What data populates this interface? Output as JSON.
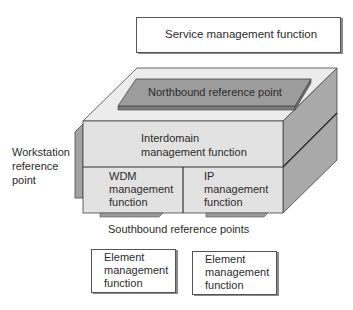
{
  "diagram": {
    "service_box": {
      "label": "Service management function"
    },
    "northbound": {
      "label": "Northbound reference point"
    },
    "interdomain": {
      "line1": "Interdomain",
      "line2": "management function"
    },
    "wdm": {
      "line1": "WDM",
      "line2": "management",
      "line3": "function"
    },
    "ip": {
      "line1": "IP",
      "line2": "management",
      "line3": "function"
    },
    "workstation": {
      "line1": "Workstation",
      "line2": "reference",
      "line3": "point"
    },
    "southbound": {
      "label": "Southbound reference points"
    },
    "element_boxes": [
      {
        "line1": "Element",
        "line2": "management",
        "line3": "function"
      },
      {
        "line1": "Element",
        "line2": "management",
        "line3": "function"
      }
    ],
    "colors": {
      "face_light": "#e4e4e4",
      "face_top": "#ececec",
      "face_side": "#a9a9a9",
      "slab": "#9c9c9c",
      "outline": "#3a3a3a"
    }
  }
}
